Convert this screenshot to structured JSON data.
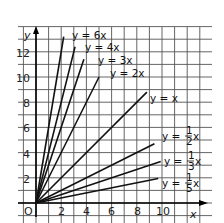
{
  "chart_data": {
    "type": "line",
    "title": "",
    "xlabel": "x",
    "ylabel": "y",
    "xlim": [
      -1.4,
      13.6
    ],
    "ylim": [
      -1.5,
      14
    ],
    "grid": true,
    "x_ticks": [
      0,
      2,
      4,
      6,
      8,
      10
    ],
    "x_tick_labels": [
      "O",
      "2",
      "4",
      "6",
      "8",
      "10"
    ],
    "y_ticks": [
      2,
      4,
      6,
      8,
      10,
      12
    ],
    "y_tick_labels": [
      "2",
      "4",
      "6",
      "8",
      "10",
      "12"
    ],
    "series": [
      {
        "name": "y = 6x",
        "slope": 6,
        "x": [
          0,
          2.2
        ],
        "y": [
          0,
          13.2
        ],
        "label_lines": [
          "y = 6x"
        ]
      },
      {
        "name": "y = 4x",
        "slope": 4,
        "x": [
          0,
          3.1
        ],
        "y": [
          0,
          12.4
        ],
        "label_lines": [
          "y = 4x"
        ]
      },
      {
        "name": "y = 3x",
        "slope": 3,
        "x": [
          0,
          3.8
        ],
        "y": [
          0,
          11.4
        ],
        "label_lines": [
          "y = 3x"
        ]
      },
      {
        "name": "y = 2x",
        "slope": 2,
        "x": [
          0,
          5.0
        ],
        "y": [
          0,
          10.0
        ],
        "label_lines": [
          "y = 2x"
        ]
      },
      {
        "name": "y = x",
        "slope": 1,
        "x": [
          0,
          8.8
        ],
        "y": [
          0,
          8.8
        ],
        "label_lines": [
          "y = x"
        ]
      },
      {
        "name": "y = 1/2 x",
        "slope": 0.5,
        "x": [
          0,
          9.4
        ],
        "y": [
          0,
          4.7
        ],
        "label_lines": [
          "y = ",
          "1",
          "2",
          "x"
        ]
      },
      {
        "name": "y = 1/3 x",
        "slope": 0.3333,
        "x": [
          0,
          9.9
        ],
        "y": [
          0,
          3.3
        ],
        "label_lines": [
          "y = ",
          "1",
          "3",
          "x"
        ]
      },
      {
        "name": "y = 1/5 x",
        "slope": 0.2,
        "x": [
          0,
          9.7
        ],
        "y": [
          0,
          1.94
        ],
        "label_lines": [
          "y = ",
          "1",
          "5",
          "x"
        ]
      }
    ]
  },
  "labels": {
    "y_axis": "y",
    "x_axis": "x",
    "origin": "O",
    "eq_6x": "y = 6x",
    "eq_4x": "y = 4x",
    "eq_3x": "y = 3x",
    "eq_2x": "y = 2x",
    "eq_x": "y = x",
    "eq_half_prefix": "y = ",
    "eq_half_num": "1",
    "eq_half_den": "2",
    "eq_third_prefix": "y = ",
    "eq_third_num": "1",
    "eq_third_den": "3",
    "eq_fifth_prefix": "y = ",
    "eq_fifth_num": "1",
    "eq_fifth_den": "5",
    "eq_suffix": "x",
    "ytick_2": "2",
    "ytick_4": "4",
    "ytick_6": "6",
    "ytick_8": "8",
    "ytick_10": "10",
    "ytick_12": "12",
    "xtick_2": "2",
    "xtick_4": "4",
    "xtick_6": "6",
    "xtick_8": "8",
    "xtick_10": "10"
  }
}
